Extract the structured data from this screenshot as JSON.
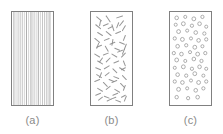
{
  "figure": {
    "title": "",
    "background_color": "#ffffff",
    "panel_border_color": "#808080",
    "feature_color": "#8c8c8c",
    "label_color": "#8a8a8a"
  },
  "panels": [
    {
      "id": "a",
      "label": "(a)",
      "type": "continuous-aligned-fibers",
      "description": "Continuous and aligned fiber composite",
      "feature_count": 19,
      "feature_shape": "vertical-line"
    },
    {
      "id": "b",
      "label": "(b)",
      "type": "discontinuous-random-fibers",
      "description": "Discontinuous randomly oriented short fiber composite",
      "feature_count": 64,
      "feature_shape": "short-line-segment"
    },
    {
      "id": "c",
      "label": "(c)",
      "type": "particulate",
      "description": "Particle reinforced composite",
      "feature_count": 52,
      "feature_shape": "small-circle"
    }
  ],
  "chart_data": {
    "type": "diagram",
    "title": "",
    "xlabel": "",
    "ylabel": "",
    "categories": [
      "(a)",
      "(b)",
      "(c)"
    ],
    "series": [
      {
        "name": "reinforcement feature count",
        "values": [
          19,
          64,
          52
        ]
      }
    ],
    "annotations": [
      "(a)",
      "(b)",
      "(c)"
    ],
    "legend": []
  },
  "geometry": {
    "panel_a": {
      "x": 11,
      "y": 11,
      "w": 43,
      "h": 95
    },
    "panel_b": {
      "x": 90,
      "y": 11,
      "w": 43,
      "h": 95
    },
    "panel_c": {
      "x": 169,
      "y": 11,
      "w": 43,
      "h": 95
    }
  },
  "features": {
    "a_lines_x": [
      2.0,
      4.2,
      6.4,
      8.6,
      10.8,
      13.0,
      15.2,
      17.4,
      19.6,
      21.0,
      23.2,
      25.4,
      27.6,
      29.8,
      32.0,
      34.2,
      36.4,
      38.0,
      39.8
    ],
    "b_segments": [
      [
        6,
        5,
        11,
        9
      ],
      [
        16,
        4,
        20,
        10
      ],
      [
        27,
        6,
        33,
        4
      ],
      [
        34,
        9,
        30,
        14
      ],
      [
        5,
        13,
        10,
        17
      ],
      [
        13,
        14,
        18,
        12
      ],
      [
        22,
        13,
        24,
        19
      ],
      [
        36,
        14,
        33,
        19
      ],
      [
        7,
        21,
        12,
        24
      ],
      [
        16,
        20,
        21,
        24
      ],
      [
        26,
        22,
        31,
        20
      ],
      [
        36,
        24,
        34,
        29
      ],
      [
        4,
        27,
        9,
        31
      ],
      [
        14,
        29,
        19,
        27
      ],
      [
        23,
        28,
        22,
        34
      ],
      [
        30,
        31,
        35,
        33
      ],
      [
        6,
        36,
        11,
        34
      ],
      [
        15,
        35,
        18,
        40
      ],
      [
        25,
        37,
        30,
        39
      ],
      [
        35,
        38,
        33,
        43
      ],
      [
        4,
        43,
        9,
        46
      ],
      [
        13,
        44,
        18,
        42
      ],
      [
        22,
        43,
        27,
        46
      ],
      [
        32,
        46,
        36,
        42
      ],
      [
        7,
        50,
        12,
        53
      ],
      [
        16,
        51,
        20,
        47
      ],
      [
        24,
        52,
        29,
        50
      ],
      [
        34,
        50,
        36,
        55
      ],
      [
        5,
        57,
        10,
        59
      ],
      [
        14,
        58,
        19,
        55
      ],
      [
        23,
        58,
        27,
        62
      ],
      [
        32,
        59,
        36,
        57
      ],
      [
        6,
        64,
        11,
        67
      ],
      [
        15,
        65,
        19,
        62
      ],
      [
        24,
        66,
        29,
        68
      ],
      [
        33,
        65,
        37,
        69
      ],
      [
        4,
        71,
        9,
        69
      ],
      [
        13,
        72,
        17,
        76
      ],
      [
        22,
        72,
        27,
        70
      ],
      [
        31,
        73,
        35,
        77
      ],
      [
        7,
        78,
        12,
        81
      ],
      [
        16,
        79,
        20,
        76
      ],
      [
        25,
        79,
        30,
        82
      ],
      [
        34,
        80,
        36,
        75
      ],
      [
        5,
        85,
        10,
        83
      ],
      [
        14,
        86,
        19,
        88
      ],
      [
        23,
        85,
        28,
        83
      ],
      [
        32,
        87,
        36,
        85
      ],
      [
        8,
        90,
        12,
        87
      ],
      [
        17,
        91,
        21,
        89
      ],
      [
        26,
        90,
        31,
        92
      ],
      [
        35,
        91,
        37,
        86
      ],
      [
        10,
        9,
        9,
        14
      ],
      [
        20,
        33,
        25,
        31
      ],
      [
        29,
        11,
        27,
        16
      ],
      [
        11,
        62,
        9,
        67
      ],
      [
        28,
        41,
        33,
        39
      ],
      [
        19,
        69,
        24,
        71
      ],
      [
        8,
        32,
        6,
        37
      ],
      [
        30,
        57,
        35,
        60
      ],
      [
        12,
        47,
        9,
        51
      ],
      [
        21,
        89,
        26,
        87
      ],
      [
        37,
        33,
        35,
        38
      ],
      [
        18,
        17,
        22,
        15
      ]
    ],
    "c_particles": [
      [
        7,
        6,
        1.9
      ],
      [
        16,
        5,
        1.6
      ],
      [
        25,
        7,
        2.0
      ],
      [
        34,
        5,
        1.7
      ],
      [
        6,
        13,
        1.6
      ],
      [
        14,
        12,
        2.0
      ],
      [
        23,
        14,
        1.7
      ],
      [
        31,
        12,
        1.9
      ],
      [
        38,
        15,
        1.6
      ],
      [
        9,
        20,
        2.0
      ],
      [
        18,
        19,
        1.6
      ],
      [
        27,
        21,
        1.9
      ],
      [
        36,
        22,
        1.7
      ],
      [
        5,
        27,
        1.7
      ],
      [
        13,
        28,
        2.0
      ],
      [
        22,
        27,
        1.6
      ],
      [
        30,
        29,
        1.9
      ],
      [
        38,
        28,
        1.7
      ],
      [
        8,
        35,
        1.9
      ],
      [
        17,
        34,
        1.7
      ],
      [
        26,
        36,
        2.0
      ],
      [
        34,
        35,
        1.6
      ],
      [
        4,
        42,
        1.7
      ],
      [
        12,
        43,
        1.9
      ],
      [
        21,
        41,
        1.6
      ],
      [
        29,
        43,
        2.0
      ],
      [
        37,
        42,
        1.7
      ],
      [
        7,
        49,
        2.0
      ],
      [
        16,
        50,
        1.6
      ],
      [
        25,
        48,
        1.9
      ],
      [
        33,
        50,
        1.7
      ],
      [
        5,
        57,
        1.6
      ],
      [
        14,
        56,
        2.0
      ],
      [
        23,
        58,
        1.7
      ],
      [
        31,
        56,
        1.9
      ],
      [
        38,
        58,
        1.6
      ],
      [
        8,
        64,
        1.9
      ],
      [
        17,
        65,
        1.7
      ],
      [
        26,
        63,
        2.0
      ],
      [
        35,
        65,
        1.6
      ],
      [
        5,
        71,
        1.7
      ],
      [
        13,
        72,
        1.9
      ],
      [
        22,
        70,
        1.6
      ],
      [
        30,
        72,
        2.0
      ],
      [
        38,
        71,
        1.7
      ],
      [
        9,
        79,
        2.0
      ],
      [
        18,
        78,
        1.6
      ],
      [
        27,
        80,
        1.9
      ],
      [
        35,
        78,
        1.7
      ],
      [
        7,
        87,
        1.8
      ],
      [
        19,
        88,
        1.7
      ],
      [
        29,
        87,
        1.9
      ]
    ]
  }
}
